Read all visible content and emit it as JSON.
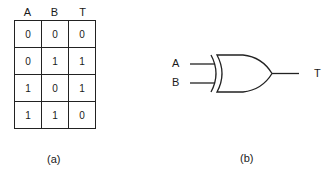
{
  "truth_table": {
    "headers": [
      "A",
      "B",
      "T"
    ],
    "rows": [
      [
        "0",
        "0",
        "0"
      ],
      [
        "0",
        "1",
        "1"
      ],
      [
        "1",
        "0",
        "1"
      ],
      [
        "1",
        "1",
        "0"
      ]
    ]
  },
  "gate": {
    "type": "XOR",
    "inputs": [
      "A",
      "B"
    ],
    "output": "T"
  },
  "captions": {
    "a": "(a)",
    "b": "(b)"
  }
}
